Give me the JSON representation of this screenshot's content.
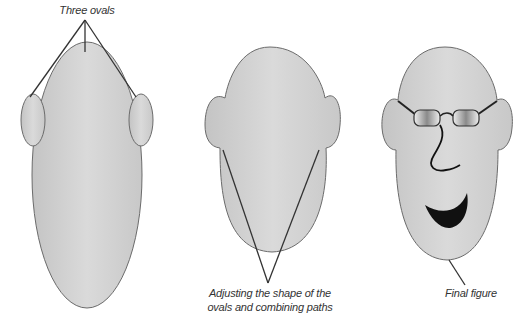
{
  "figure": {
    "colors": {
      "fill_light": "#d9d9d9",
      "fill_dark": "#bdbdbd",
      "stroke": "#6b6b6b",
      "leader": "#333333",
      "mouth": "#111111"
    },
    "labels": {
      "three_ovals": "Three ovals",
      "adjusting_line1": "Adjusting the shape of the",
      "adjusting_line2": "ovals and combining paths",
      "final": "Final figure"
    },
    "stages": [
      {
        "name": "three-ovals",
        "description": "Head oval with two ear ovals"
      },
      {
        "name": "combined-path",
        "description": "Adjusted and combined head shape"
      },
      {
        "name": "final-figure",
        "description": "Face with glasses, nose and mouth"
      }
    ]
  }
}
